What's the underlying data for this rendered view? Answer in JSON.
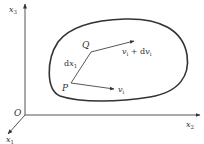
{
  "diagram": {
    "type": "continuum-kinematics",
    "axes": {
      "x3": {
        "label": "x",
        "subscript": "3"
      },
      "x2": {
        "label": "x",
        "subscript": "2"
      },
      "x1": {
        "label": "x",
        "subscript": "1"
      },
      "origin": "O"
    },
    "points": {
      "P": "P",
      "Q": "Q"
    },
    "segment_label": {
      "prefix": "d",
      "var": "x",
      "subscript": "1"
    },
    "vectors": {
      "at_P": {
        "var": "v",
        "subscript": "i"
      },
      "at_Q": {
        "var": "v",
        "subscript": "i",
        "plus": " + d",
        "var2": "v",
        "subscript2": "i"
      }
    },
    "colors": {
      "stroke": "#333333",
      "axis": "#555555",
      "background": "#ffffff"
    }
  }
}
